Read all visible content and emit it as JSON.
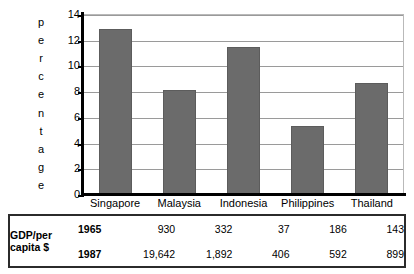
{
  "chart_data": {
    "type": "bar",
    "title": "",
    "xlabel": "",
    "ylabel": "percentage",
    "ylabel_letters": [
      "p",
      "e",
      "r",
      "c",
      "e",
      "n",
      "t",
      "a",
      "g",
      "e"
    ],
    "categories": [
      "Singapore",
      "Malaysia",
      "Indonesia",
      "Philippines",
      "Thailand"
    ],
    "values": [
      12.9,
      8.2,
      11.5,
      5.4,
      8.7
    ],
    "ylim": [
      0,
      14
    ],
    "yticks": [
      0,
      2,
      4,
      6,
      8,
      10,
      12,
      14
    ],
    "ytick_labels": [
      "0",
      "2",
      "4",
      "6",
      "8",
      "10",
      "12",
      "14"
    ],
    "grid": true,
    "legend": "none",
    "bar_color": "#6b6b6b",
    "gridline_color": "#9a9a9a",
    "axis_color": "#000000"
  },
  "table": {
    "row_label_line1": "GDP/per",
    "row_label_line2": "capita $",
    "rows": [
      {
        "year": "1965",
        "values": [
          "930",
          "332",
          "37",
          "186",
          "143"
        ]
      },
      {
        "year": "1987",
        "values": [
          "19,642",
          "1,892",
          "406",
          "592",
          "899"
        ]
      }
    ]
  }
}
